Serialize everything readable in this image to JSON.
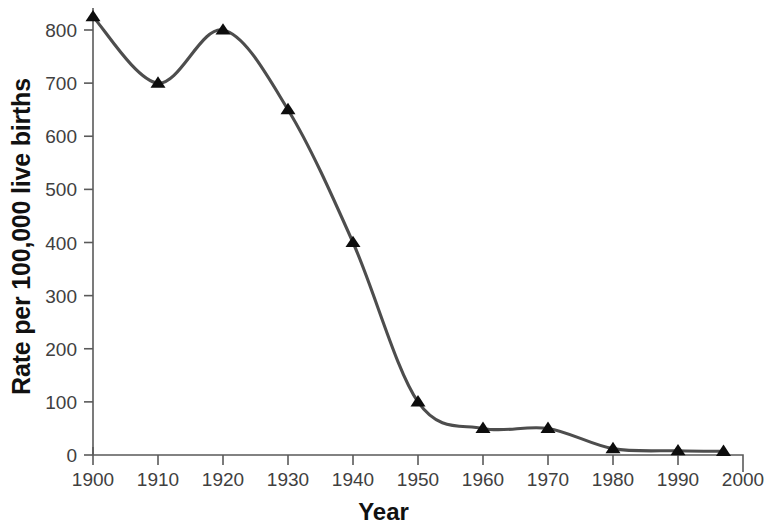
{
  "chart_data": {
    "type": "line",
    "title": "",
    "subtitle": "",
    "xlabel": "Year",
    "ylabel": "Rate per 100,000 live births",
    "x": [
      1900,
      1910,
      1920,
      1930,
      1940,
      1950,
      1960,
      1970,
      1980,
      1990,
      1997
    ],
    "values": [
      825,
      700,
      800,
      650,
      400,
      100,
      50,
      50,
      12,
      8,
      7
    ],
    "series": [
      {
        "name": "Maternal mortality rate",
        "x": [
          1900,
          1910,
          1920,
          1930,
          1940,
          1950,
          1960,
          1970,
          1980,
          1990,
          1997
        ],
        "values": [
          825,
          700,
          800,
          650,
          400,
          100,
          50,
          50,
          12,
          8,
          7
        ]
      }
    ],
    "xlim": [
      1900,
      2000
    ],
    "ylim": [
      0,
      800
    ],
    "xticks": [
      1900,
      1910,
      1920,
      1930,
      1940,
      1950,
      1960,
      1970,
      1980,
      1990,
      2000
    ],
    "xtick_labels": [
      "1900",
      "1910",
      "1920",
      "1930",
      "1940",
      "1950",
      "1960",
      "1970",
      "1980",
      "1990",
      "2000"
    ],
    "yticks": [
      0,
      100,
      200,
      300,
      400,
      500,
      600,
      700,
      800
    ],
    "ytick_labels": [
      "0",
      "100",
      "200",
      "300",
      "400",
      "500",
      "600",
      "700",
      "800"
    ],
    "grid": false,
    "legend": "none",
    "marker": "triangle",
    "line_color": "#4d4d4d",
    "marker_color": "#0d0d0d",
    "axis_color": "#5a5a5a",
    "background_color": "#ffffff",
    "smoothing": "spline"
  }
}
